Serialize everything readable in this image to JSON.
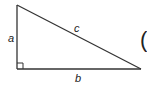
{
  "diagram": {
    "type": "right-triangle",
    "stroke_color": "#333333",
    "background": "#ffffff",
    "vertices": {
      "top": [
        17,
        5
      ],
      "right_angle": [
        17,
        69
      ],
      "right": [
        141,
        69
      ]
    },
    "labels": {
      "side_a": "a",
      "side_b": "b",
      "side_c": "c"
    },
    "right_angle_marker": true,
    "partial_glyph": "("
  }
}
